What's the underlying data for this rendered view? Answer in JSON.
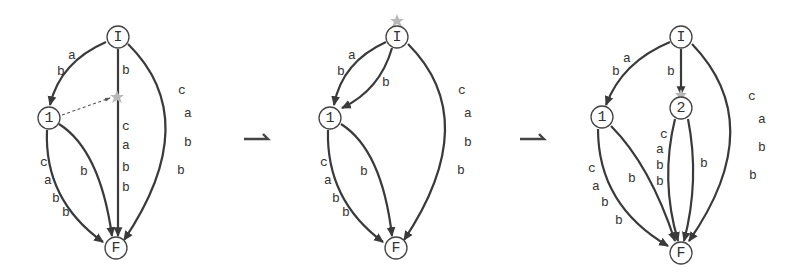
{
  "figure": {
    "transition_arrows": [
      "⇀",
      "⇀"
    ],
    "diagrams": [
      {
        "id": "step-1",
        "nodes": [
          {
            "id": "I",
            "label": "I"
          },
          {
            "id": "1",
            "label": "1"
          },
          {
            "id": "F",
            "label": "F"
          }
        ],
        "edges": [
          {
            "from": "I",
            "to": "1",
            "labels": [
              "a",
              "b"
            ]
          },
          {
            "from": "I",
            "to": "F",
            "labels_top": [
              "b"
            ],
            "labels_bottom": [
              "c",
              "a",
              "b",
              "b"
            ],
            "marker": "star"
          },
          {
            "from": "I",
            "to": "F",
            "side": "right",
            "labels": [
              "c",
              "a",
              "b",
              "b"
            ]
          },
          {
            "from": "1",
            "to": "F",
            "side": "left",
            "labels": [
              "c",
              "a",
              "b",
              "b"
            ]
          },
          {
            "from": "1",
            "to": "F",
            "side": "inner",
            "labels": [
              "b"
            ]
          },
          {
            "from": "1",
            "to": "star",
            "style": "dashed"
          }
        ]
      },
      {
        "id": "step-2",
        "nodes": [
          {
            "id": "I",
            "label": "I",
            "marker": "star"
          },
          {
            "id": "1",
            "label": "1"
          },
          {
            "id": "F",
            "label": "F"
          }
        ],
        "edges": [
          {
            "from": "I",
            "to": "1",
            "side": "outer",
            "labels": [
              "a",
              "b"
            ]
          },
          {
            "from": "I",
            "to": "1",
            "side": "inner",
            "labels": [
              "b"
            ]
          },
          {
            "from": "I",
            "to": "F",
            "side": "right",
            "labels": [
              "c",
              "a",
              "b",
              "b"
            ]
          },
          {
            "from": "1",
            "to": "F",
            "side": "left",
            "labels": [
              "c",
              "a",
              "b",
              "b"
            ]
          },
          {
            "from": "1",
            "to": "F",
            "side": "inner",
            "labels": [
              "b"
            ]
          }
        ]
      },
      {
        "id": "step-3",
        "nodes": [
          {
            "id": "I",
            "label": "I"
          },
          {
            "id": "1",
            "label": "1"
          },
          {
            "id": "2",
            "label": "2",
            "marker": "star"
          },
          {
            "id": "F",
            "label": "F"
          }
        ],
        "edges": [
          {
            "from": "I",
            "to": "1",
            "labels": [
              "a",
              "b"
            ]
          },
          {
            "from": "I",
            "to": "2",
            "labels": [
              "b"
            ]
          },
          {
            "from": "I",
            "to": "F",
            "side": "right",
            "labels": [
              "c",
              "a",
              "b",
              "b"
            ]
          },
          {
            "from": "1",
            "to": "F",
            "side": "left",
            "labels": [
              "c",
              "a",
              "b",
              "b"
            ]
          },
          {
            "from": "1",
            "to": "F",
            "side": "inner",
            "labels": [
              "b"
            ]
          },
          {
            "from": "2",
            "to": "F",
            "side": "left",
            "labels": [
              "c",
              "a",
              "b",
              "b"
            ]
          },
          {
            "from": "2",
            "to": "F",
            "side": "right",
            "labels": [
              "b"
            ]
          }
        ]
      }
    ]
  },
  "d1": {
    "I": "I",
    "n1": "1",
    "F": "F",
    "e_I_1": [
      "a",
      "b"
    ],
    "e_I_F_top": [
      "b"
    ],
    "e_I_F_mid": [
      "c",
      "a",
      "b",
      "b"
    ],
    "e_I_F_right": [
      "c",
      "a",
      "b",
      "b"
    ],
    "e_1_F_left": [
      "c",
      "a",
      "b",
      "b"
    ],
    "e_1_F_inner": [
      "b"
    ]
  },
  "d2": {
    "I": "I",
    "n1": "1",
    "F": "F",
    "e_I_1_outer": [
      "a",
      "b"
    ],
    "e_I_1_inner": [
      "b"
    ],
    "e_I_F_right": [
      "c",
      "a",
      "b",
      "b"
    ],
    "e_1_F_left": [
      "c",
      "a",
      "b",
      "b"
    ],
    "e_1_F_inner": [
      "b"
    ]
  },
  "d3": {
    "I": "I",
    "n1": "1",
    "n2": "2",
    "F": "F",
    "e_I_1": [
      "a",
      "b"
    ],
    "e_I_2": [
      "b"
    ],
    "e_I_F_right": [
      "c",
      "a",
      "b",
      "b"
    ],
    "e_1_F_left": [
      "c",
      "a",
      "b",
      "b"
    ],
    "e_1_F_inner": [
      "b"
    ],
    "e_2_F_left": [
      "c",
      "a",
      "b",
      "b"
    ],
    "e_2_F_right": [
      "b"
    ]
  }
}
